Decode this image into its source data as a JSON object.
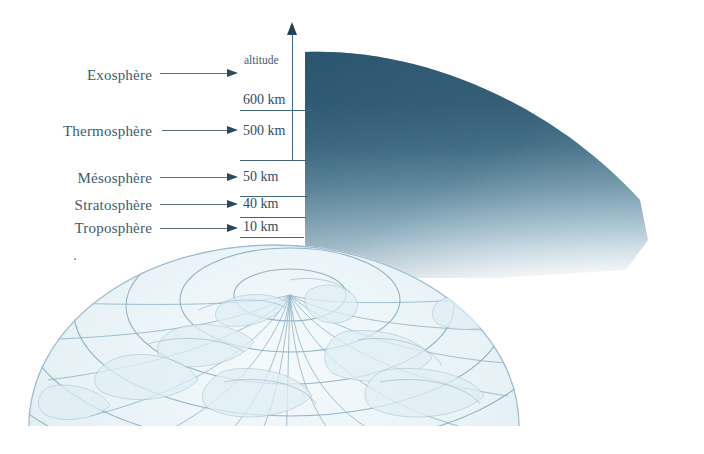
{
  "figure": {
    "background_color": "#ffffff",
    "text_color": "#3d5b6e",
    "axis_color": "#44667c",
    "arrow_color": "#2b4a5e",
    "atmosphere_dark_color": "#28536b",
    "atmosphere_light_color": "#ffffff",
    "globe_line_color": "#8fb0c4",
    "globe_fill_color": "#e8f2f6"
  },
  "axis": {
    "caption": "altitude",
    "direction": "up"
  },
  "layers": [
    {
      "name": "Exosphère",
      "altitude_label": "600 km",
      "altitude_km": 600
    },
    {
      "name": "Thermosphère",
      "altitude_label": "500 km",
      "altitude_km": 500
    },
    {
      "name": "Mésosphère",
      "altitude_label": "50 km",
      "altitude_km": 50
    },
    {
      "name": "Stratosphère",
      "altitude_label": "40 km",
      "altitude_km": 40
    },
    {
      "name": "Troposphère",
      "altitude_label": "10 km",
      "altitude_km": 10
    }
  ],
  "globe": {
    "pole_marker": "+",
    "projection": "polar",
    "latitude_circles": 6,
    "longitude_lines": 24
  }
}
